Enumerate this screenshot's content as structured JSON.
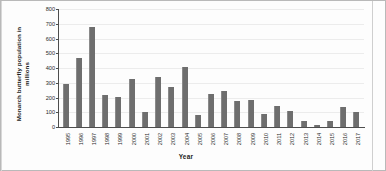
{
  "chart_data": {
    "type": "bar",
    "title": "",
    "xlabel": "Year",
    "ylabel": "Monarch butterfly population in millions",
    "ylabel_line1": "Monarch butterfly population in",
    "ylabel_line2": "millions",
    "ylim": [
      0,
      800
    ],
    "ytick_step": 100,
    "yticks": [
      0,
      100,
      200,
      300,
      400,
      500,
      600,
      700,
      800
    ],
    "grid": true,
    "legend": "none",
    "bar_color": "#6e6e6e",
    "categories": [
      "1995",
      "1996",
      "1997",
      "1998",
      "1999",
      "2000",
      "2001",
      "2002",
      "2003",
      "2004",
      "2005",
      "2006",
      "2007",
      "2008",
      "2009",
      "2010",
      "2011",
      "2012",
      "2013",
      "2014",
      "2015",
      "2016",
      "2017"
    ],
    "values": [
      290,
      470,
      680,
      220,
      205,
      325,
      100,
      342,
      272,
      405,
      80,
      225,
      247,
      175,
      182,
      85,
      140,
      110,
      40,
      17,
      38,
      137,
      100
    ],
    "units": "millions"
  }
}
